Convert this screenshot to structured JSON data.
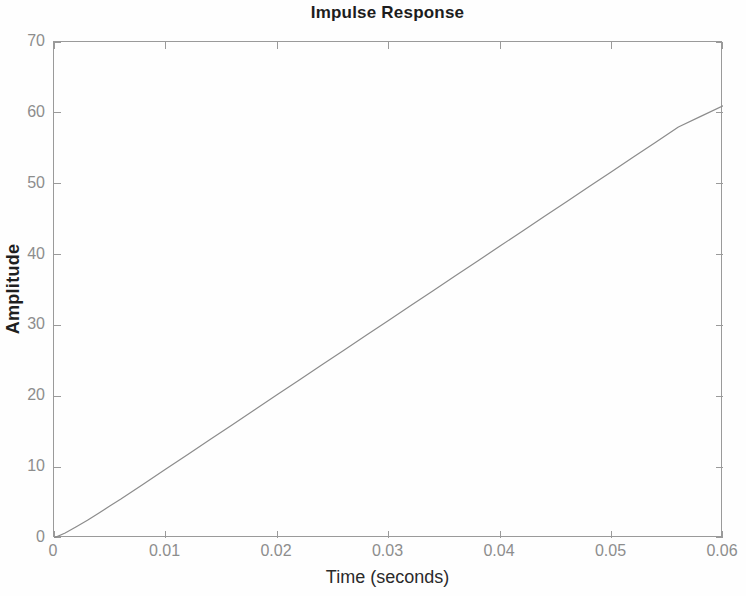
{
  "chart_data": {
    "type": "line",
    "title": "Impulse Response",
    "xlabel": "Time (seconds)",
    "ylabel": "Amplitude",
    "xlim": [
      0,
      0.06
    ],
    "ylim": [
      0,
      70
    ],
    "grid": false,
    "legend": null,
    "xticks": [
      0,
      0.01,
      0.02,
      0.03,
      0.04,
      0.05,
      0.06
    ],
    "xtick_labels": [
      "0",
      "0.01",
      "0.02",
      "0.03",
      "0.04",
      "0.05",
      "0.06"
    ],
    "yticks": [
      0,
      10,
      20,
      30,
      40,
      50,
      60,
      70
    ],
    "ytick_labels": [
      "0",
      "10",
      "20",
      "30",
      "40",
      "50",
      "60",
      "70"
    ],
    "line_color": "#8c8c8c",
    "line_width": 1.2,
    "series": [
      {
        "name": "Impulse Response",
        "x": [
          0,
          0.001,
          0.002,
          0.003,
          0.004,
          0.005,
          0.006,
          0.008,
          0.01,
          0.012,
          0.014,
          0.016,
          0.018,
          0.02,
          0.022,
          0.024,
          0.026,
          0.028,
          0.03,
          0.032,
          0.034,
          0.036,
          0.038,
          0.04,
          0.042,
          0.044,
          0.046,
          0.048,
          0.05,
          0.052,
          0.054,
          0.056,
          0.058,
          0.06
        ],
        "y": [
          0,
          0.7,
          1.6,
          2.5,
          3.5,
          4.5,
          5.5,
          7.6,
          9.7,
          11.8,
          13.9,
          16.0,
          18.1,
          20.2,
          22.3,
          24.4,
          26.5,
          28.6,
          30.7,
          32.8,
          34.9,
          37.0,
          39.1,
          41.2,
          43.3,
          45.4,
          47.5,
          49.6,
          51.7,
          53.8,
          55.9,
          58.0,
          59.5,
          61.0
        ]
      }
    ]
  },
  "figure": {
    "background_color": "#fefefe",
    "axes_color": "#9a9a9a",
    "tick_label_color": "#8d8d8d",
    "title_color": "#1d1d1d"
  }
}
